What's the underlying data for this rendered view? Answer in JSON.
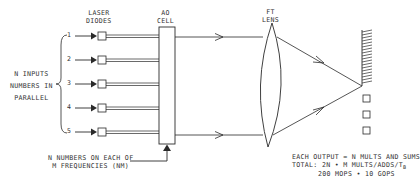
{
  "diagram": {
    "labels": {
      "laser_diodes": [
        "LASER",
        "DIODES"
      ],
      "ao_cell": [
        "AO",
        "CELL"
      ],
      "ft_lens": [
        "FT",
        "LENS"
      ],
      "n_inputs": [
        "N INPUTS",
        "NUMBERS IN",
        "PARALLEL"
      ],
      "ao_input": [
        "N NUMBERS ON EACH OF",
        "M FREQUENCIES (NM)"
      ],
      "summary": {
        "line1": "EACH OUTPUT = N MULTS AND SUMS",
        "line2_prefix": "TOTAL:   2N • M MULTS/ADDS/T",
        "line2_sub": "B",
        "line3": "200 MOPS • 10 GOPS"
      }
    },
    "inputs": [
      {
        "index": "1",
        "y": 36
      },
      {
        "index": "2",
        "y": 60
      },
      {
        "index": "3",
        "y": 84
      },
      {
        "index": "4",
        "y": 108
      },
      {
        "index": "5",
        "y": 132
      }
    ],
    "output_detectors": 3,
    "colors": {
      "line": "#2a2a2a",
      "background": "#ffffff"
    }
  }
}
